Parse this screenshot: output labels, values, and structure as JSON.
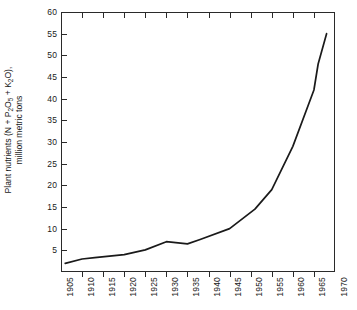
{
  "chart_data": {
    "type": "line",
    "title": "",
    "subtitle": "",
    "xlabel": "",
    "ylabel": "Plant nutrients (N + P2O5 + K2O), million metric tons",
    "ylabel_line1_prefix": "Plant nutrients (N + P",
    "ylabel_line1_sub1": "2",
    "ylabel_line1_mid": "O",
    "ylabel_line1_sub2": "5",
    "ylabel_line1_mid2": " + K",
    "ylabel_line1_sub3": "2",
    "ylabel_line1_suffix": "O),",
    "ylabel_line2": "million metric tons",
    "xlim": [
      1905,
      1970
    ],
    "ylim": [
      0,
      60
    ],
    "grid": false,
    "legend": false,
    "legend_position": "none",
    "x_tick_labels": [
      "1905",
      "1910",
      "1915",
      "1920",
      "1925",
      "1930",
      "1935",
      "1940",
      "1945",
      "1950",
      "1955",
      "1960",
      "1965",
      "1970"
    ],
    "x_ticks": [
      1905,
      1910,
      1915,
      1920,
      1925,
      1930,
      1935,
      1940,
      1945,
      1950,
      1955,
      1960,
      1965,
      1970
    ],
    "y_tick_labels": [
      "5",
      "10",
      "15",
      "20",
      "25",
      "30",
      "35",
      "40",
      "45",
      "50",
      "55",
      "60"
    ],
    "y_ticks": [
      5,
      10,
      15,
      20,
      25,
      30,
      35,
      40,
      45,
      50,
      55,
      60
    ],
    "series": [
      {
        "name": "World fertilizer consumption",
        "color": "#1a1a1a",
        "x": [
          1906,
          1910,
          1913,
          1920,
          1925,
          1930,
          1935,
          1938,
          1945,
          1951,
          1955,
          1960,
          1965,
          1966,
          1968
        ],
        "values": [
          2.0,
          3.0,
          3.3,
          4.0,
          5.1,
          7.0,
          6.5,
          7.5,
          10.0,
          14.5,
          19.0,
          29.0,
          42.0,
          48.0,
          55.0
        ]
      }
    ],
    "annotations": []
  }
}
